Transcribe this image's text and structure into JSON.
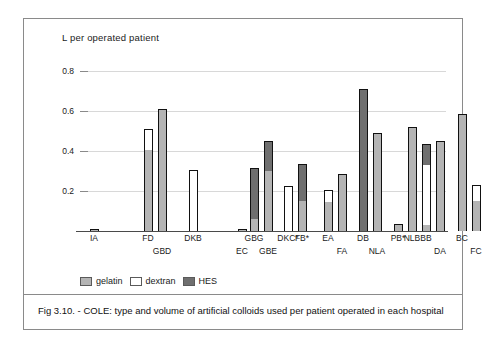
{
  "figure": {
    "caption": "Fig 3.10. - COLE: type and volume of  artificial colloids used per patient operated in each hospital"
  },
  "legend": {
    "items": [
      {
        "label": "gelatin",
        "color": "#b4b4b4",
        "swatch": "gelatin-swatch"
      },
      {
        "label": "dextran",
        "color": "#ffffff",
        "swatch": "dextran-swatch"
      },
      {
        "label": "HES",
        "color": "#6f6f6f",
        "swatch": "hes-swatch"
      }
    ]
  },
  "chart_data": {
    "type": "bar",
    "stacked": true,
    "title": "L  per operated patient",
    "xlabel": "",
    "ylabel": "L per operated patient",
    "ylim": [
      0,
      0.85
    ],
    "yticks": [
      0.2,
      0.4,
      0.6,
      0.8
    ],
    "ytick_labels": [
      "0.2",
      "0.4",
      "0.6",
      "0.8"
    ],
    "grid": "horizontal",
    "legend_position": "below-axis-left",
    "categories": [
      "IA",
      "FD",
      "GBD",
      "DKB",
      "EC",
      "GBG",
      "GBE",
      "DKC*",
      "FB*",
      "EA",
      "FA",
      "DB",
      "NLA",
      "PB*",
      "NLB",
      "BB",
      "DA",
      "BC",
      "FC",
      "BA"
    ],
    "series": [
      {
        "name": "gelatin",
        "color": "#b4b4b4",
        "values": [
          0.01,
          0.405,
          0.61,
          0.0,
          0.01,
          0.06,
          0.3,
          0.0,
          0.15,
          0.145,
          0.285,
          0.0,
          0.49,
          0.035,
          0.52,
          0.03,
          0.45,
          0.585,
          0.15,
          0.15
        ]
      },
      {
        "name": "dextran",
        "color": "#ffffff",
        "values": [
          0.0,
          0.105,
          0.0,
          0.305,
          0.0,
          0.0,
          0.0,
          0.225,
          0.0,
          0.06,
          0.0,
          0.0,
          0.0,
          0.0,
          0.0,
          0.3,
          0.0,
          0.0,
          0.08,
          0.0
        ]
      },
      {
        "name": "HES",
        "color": "#6f6f6f",
        "values": [
          0.0,
          0.0,
          0.0,
          0.0,
          0.0,
          0.255,
          0.15,
          0.0,
          0.185,
          0.0,
          0.0,
          0.71,
          0.0,
          0.0,
          0.0,
          0.105,
          0.0,
          0.0,
          0.0,
          0.0
        ]
      }
    ],
    "totals": [
      0.01,
      0.51,
      0.61,
      0.305,
      0.01,
      0.315,
      0.45,
      0.225,
      0.335,
      0.205,
      0.285,
      0.71,
      0.49,
      0.035,
      0.52,
      0.435,
      0.45,
      0.585,
      0.23,
      0.15
    ],
    "label_rows": [
      0,
      0,
      1,
      0,
      1,
      0,
      1,
      0,
      0,
      0,
      1,
      0,
      1,
      0,
      0,
      0,
      1,
      0,
      1,
      0
    ],
    "x_positions": [
      14,
      68,
      82,
      113,
      162,
      174,
      188,
      208,
      222,
      248,
      262,
      283,
      297,
      318,
      332,
      346,
      360,
      382,
      396,
      417
    ],
    "group_breaks": [
      "after DKB",
      "after DKC*"
    ]
  }
}
